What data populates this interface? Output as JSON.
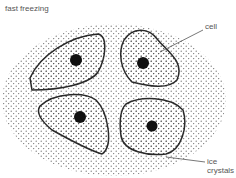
{
  "diagram": {
    "title": "fast freezing",
    "labels": {
      "cell": "cell",
      "ice_line1": "ice",
      "ice_line2": "crystals"
    },
    "colors": {
      "outline": "#2a2a2a",
      "dots": "#444444",
      "text": "#555555"
    }
  }
}
